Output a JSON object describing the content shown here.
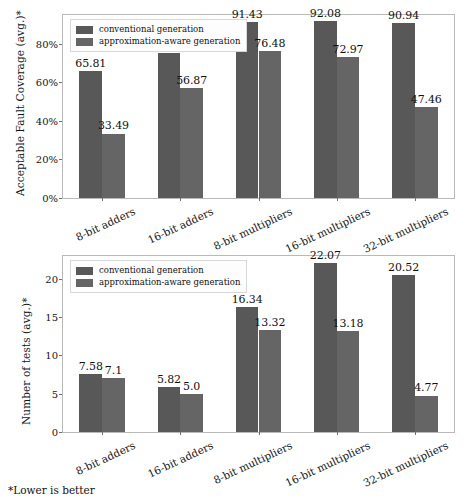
{
  "figure": {
    "footnote": "*Lower is better",
    "colors": {
      "conventional": "#585858",
      "approximation_aware": "#656565",
      "frame": "#b9b9b9",
      "text": "#111111",
      "background": "#ffffff"
    }
  },
  "legend": {
    "entries": [
      {
        "label": "conventional generation",
        "color": "#585858"
      },
      {
        "label": "approximation-aware generation",
        "color": "#656565"
      }
    ]
  },
  "chart_data": [
    {
      "type": "bar",
      "id": "acceptable-fault-coverage",
      "title": "",
      "xlabel": "",
      "ylabel": "Acceptable Fault Coverage (avg.)*",
      "ylim": [
        0,
        95
      ],
      "yticks": [
        0,
        20,
        40,
        60,
        80
      ],
      "ytick_labels": [
        "0%",
        "20%",
        "40%",
        "60%",
        "80%"
      ],
      "grid": false,
      "legend_position": "upper left",
      "categories": [
        "8-bit adders",
        "16-bit adders",
        "8-bit multipliers",
        "16-bit multipliers",
        "32-bit multipliers"
      ],
      "series": [
        {
          "name": "conventional generation",
          "color": "#585858",
          "values": [
            65.81,
            75.05,
            91.43,
            92.08,
            90.94
          ],
          "labels": [
            "65.81",
            "75.05",
            "91.43",
            "92.08",
            "90.94"
          ]
        },
        {
          "name": "approximation-aware generation",
          "color": "#656565",
          "values": [
            33.49,
            56.87,
            76.48,
            72.97,
            47.46
          ],
          "labels": [
            "33.49",
            "56.87",
            "76.48",
            "72.97",
            "47.46"
          ]
        }
      ]
    },
    {
      "type": "bar",
      "id": "number-of-tests",
      "title": "",
      "xlabel": "",
      "ylabel": "Number of tests (avg.)*",
      "ylim": [
        0,
        23
      ],
      "yticks": [
        0,
        5,
        10,
        15,
        20
      ],
      "ytick_labels": [
        "0",
        "5",
        "10",
        "15",
        "20"
      ],
      "grid": false,
      "legend_position": "upper left",
      "categories": [
        "8-bit adders",
        "16-bit adders",
        "8-bit multipliers",
        "16-bit multipliers",
        "32-bit multipliers"
      ],
      "series": [
        {
          "name": "conventional generation",
          "color": "#585858",
          "values": [
            7.58,
            5.82,
            16.34,
            22.07,
            20.52
          ],
          "labels": [
            "7.58",
            "5.82",
            "16.34",
            "22.07",
            "20.52"
          ]
        },
        {
          "name": "approximation-aware generation",
          "color": "#656565",
          "values": [
            7.1,
            5.0,
            13.32,
            13.18,
            4.77
          ],
          "labels": [
            "7.1",
            "5.0",
            "13.32",
            "13.18",
            "4.77"
          ]
        }
      ]
    }
  ]
}
